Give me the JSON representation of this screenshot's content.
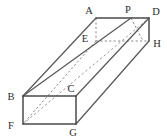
{
  "figure": {
    "shape_type": "rectangular-cuboid",
    "projection": "oblique",
    "canvas": {
      "width": 167,
      "height": 140
    },
    "colors": {
      "background": "#ffffff",
      "solid_edge": "#595959",
      "solid_edge_dark": "#4a4a4a",
      "hidden_edge": "#8a8a8a",
      "diagonal_edge": "#9a9a9a",
      "label_text": "#2b2b2b"
    },
    "vertices": [
      {
        "id": "A",
        "label": "A",
        "x": 96,
        "y": 18,
        "label_x": 89,
        "label_y": 14,
        "hidden": false
      },
      {
        "id": "P",
        "label": "P",
        "x": 131,
        "y": 18,
        "label_x": 128,
        "label_y": 13,
        "hidden": false
      },
      {
        "id": "D",
        "label": "D",
        "x": 149,
        "y": 18,
        "label_x": 153,
        "label_y": 14,
        "hidden": false
      },
      {
        "id": "E",
        "label": "E",
        "x": 96,
        "y": 41,
        "label_x": 85,
        "label_y": 41,
        "hidden": true
      },
      {
        "id": "H",
        "label": "H",
        "x": 149,
        "y": 41,
        "label_x": 153,
        "label_y": 45,
        "hidden": false
      },
      {
        "id": "B",
        "label": "B",
        "x": 23,
        "y": 96,
        "label_x": 12,
        "label_y": 100,
        "hidden": false
      },
      {
        "id": "C",
        "label": "C",
        "x": 76,
        "y": 96,
        "label_x": 71,
        "label_y": 92,
        "hidden": false
      },
      {
        "id": "F",
        "label": "F",
        "x": 23,
        "y": 124,
        "label_x": 12,
        "label_y": 128,
        "hidden": false
      },
      {
        "id": "G",
        "label": "G",
        "x": 76,
        "y": 124,
        "label_x": 72,
        "label_y": 136,
        "hidden": false
      }
    ],
    "edges": [
      {
        "from": "A",
        "to": "D",
        "style": "solid"
      },
      {
        "from": "A",
        "to": "B",
        "style": "solid"
      },
      {
        "from": "D",
        "to": "H",
        "style": "solid"
      },
      {
        "from": "D",
        "to": "C",
        "style": "solid"
      },
      {
        "from": "H",
        "to": "G",
        "style": "solid"
      },
      {
        "from": "B",
        "to": "C",
        "style": "solid"
      },
      {
        "from": "B",
        "to": "F",
        "style": "solid"
      },
      {
        "from": "C",
        "to": "G",
        "style": "solid"
      },
      {
        "from": "F",
        "to": "G",
        "style": "solid"
      },
      {
        "from": "B",
        "to": "P",
        "style": "solid"
      },
      {
        "from": "A",
        "to": "E",
        "style": "hidden"
      },
      {
        "from": "E",
        "to": "H",
        "style": "hidden"
      },
      {
        "from": "E",
        "to": "F",
        "style": "hidden"
      },
      {
        "from": "P",
        "to": "H",
        "style": "hidden"
      },
      {
        "from": "F",
        "to": "D",
        "style": "diagonal"
      }
    ],
    "notes": {
      "point_p_description": "P lies on top edge AD between A and D",
      "hidden_vertex": "E"
    }
  }
}
